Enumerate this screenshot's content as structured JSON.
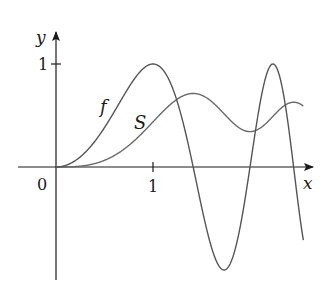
{
  "chart_data": {
    "type": "line",
    "title": "",
    "xlabel": "x",
    "ylabel": "y",
    "origin_label": "0",
    "x_ticks": [
      {
        "value": 1,
        "label": "1"
      }
    ],
    "y_ticks": [
      {
        "value": 1,
        "label": "1"
      }
    ],
    "xlim": [
      -0.39,
      2.65
    ],
    "ylim": [
      -1.1,
      1.3
    ],
    "grid": false,
    "legend": "inline curve labels",
    "series": [
      {
        "name": "f",
        "description": "f(x) = sin(pi x^2 / 2)",
        "label_pos": {
          "x": 0.5,
          "y": 0.6
        },
        "color": "#555555",
        "x": [
          0,
          0.25,
          0.5,
          0.75,
          1.0,
          1.25,
          1.414,
          1.5,
          1.732,
          2.0,
          2.236,
          2.4,
          2.55
        ],
        "y": [
          0,
          0.098,
          0.383,
          0.773,
          1.0,
          0.634,
          0.0,
          -0.383,
          -1.0,
          0.0,
          1.0,
          0.125,
          -0.52
        ]
      },
      {
        "name": "S",
        "description": "S(x) = integral from 0 to x of sin(pi t^2 / 2) dt",
        "label_pos": {
          "x": 0.87,
          "y": 0.43
        },
        "color": "#666666",
        "x": [
          0,
          0.5,
          1.0,
          1.414,
          1.732,
          2.0,
          2.236,
          2.5
        ],
        "y": [
          0,
          0.065,
          0.438,
          0.714,
          0.549,
          0.343,
          0.554,
          0.619
        ]
      }
    ]
  },
  "figure": {
    "axis_color": "#1a1a1a",
    "curve_color": "#5a5a5a"
  }
}
